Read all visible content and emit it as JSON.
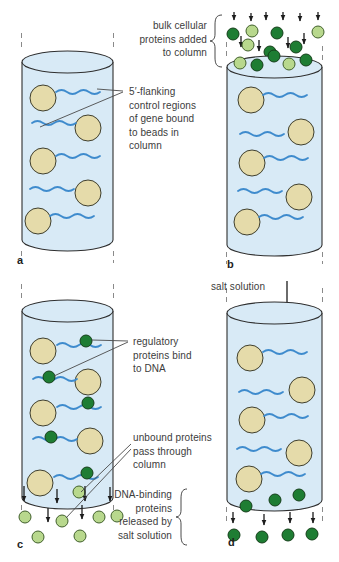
{
  "colors": {
    "column_fill": "#d8eaf6",
    "column_stroke": "#2f2f2f",
    "bead_fill": "#e5dbaa",
    "bead_stroke": "#3f3f2e",
    "dna": "#3e8bcd",
    "dark_green": "#1e7d33",
    "dark_green_stroke": "#153f1a",
    "light_green": "#b8d88d",
    "light_green_stroke": "#41602c",
    "arrow": "#1c1c1c",
    "dash": "#8a8a8a",
    "leader": "#4a4a4a",
    "text": "#3c3c3c"
  },
  "panels": {
    "a": {
      "letter": "a",
      "flanking_label": "5′-flanking\ncontrol regions\nof gene bound\nto beads in\ncolumn"
    },
    "b": {
      "letter": "b",
      "bulk_label": "bulk cellular\nproteins added\nto column"
    },
    "c": {
      "letter": "c",
      "regulatory_label": "regulatory\nproteins bind\nto DNA",
      "unbound_label": "unbound proteins\npass through\ncolumn"
    },
    "d": {
      "letter": "d",
      "salt_label": "salt solution",
      "released_label": "DNA-binding\nproteins\nreleased by\nsalt solution"
    }
  }
}
